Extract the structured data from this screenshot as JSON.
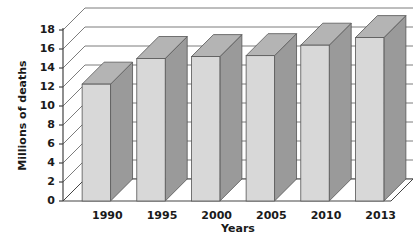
{
  "chart_data": {
    "type": "bar",
    "title": "",
    "xlabel": "Years",
    "ylabel": "Millions of deaths",
    "categories": [
      "1990",
      "1995",
      "2000",
      "2005",
      "2010",
      "2013"
    ],
    "values": [
      12.3,
      15.0,
      15.2,
      15.3,
      16.4,
      17.2
    ],
    "ylim": [
      0,
      18
    ],
    "y_ticks": [
      "0",
      "2",
      "4",
      "6",
      "8",
      "10",
      "12",
      "14",
      "16",
      "18"
    ],
    "y_tick_values": [
      0,
      2,
      4,
      6,
      8,
      10,
      12,
      14,
      16,
      18
    ],
    "grid": true,
    "legend": "none",
    "style": "3d-column",
    "colors": {
      "bar_front": "#d8d8d8",
      "bar_side": "#9a9a9a",
      "bar_top": "#b4b4b4",
      "bar_outline": "#555555",
      "gridline": "#6e6e6e",
      "axis": "#444444",
      "floor": "#ffffff",
      "text": "#1a1a1a",
      "background": "#ffffff"
    }
  }
}
